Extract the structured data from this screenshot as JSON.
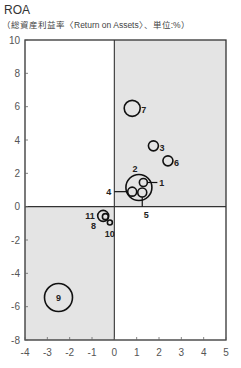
{
  "chart_data": {
    "type": "scatter",
    "title": "ROA",
    "subtitle": "（総資産利益率〈Return on Assets〉、単位:%）",
    "xlabel": "",
    "ylabel": "ROA (%)",
    "xlim": [
      -4,
      5
    ],
    "ylim": [
      -8,
      10
    ],
    "x_ticks": [
      -4,
      -3,
      -2,
      -1,
      0,
      1,
      2,
      3,
      4,
      5
    ],
    "y_ticks": [
      10,
      8,
      6,
      4,
      2,
      0,
      -2,
      -4,
      -6,
      -8
    ],
    "grid": false,
    "shaded_quadrants": [
      "top-right",
      "bottom-left"
    ],
    "colors": {
      "shade": "#e4e4e4",
      "axis": "#333333",
      "bubble_stroke": "#111111",
      "tick_text": "#555555"
    },
    "points": [
      {
        "label": "1",
        "x": 1.3,
        "y": 1.45,
        "size": 4,
        "label_pos": "right-leader"
      },
      {
        "label": "2",
        "x": 1.1,
        "y": 1.15,
        "size": 13,
        "label_pos": "top"
      },
      {
        "label": "3",
        "x": 1.75,
        "y": 3.65,
        "size": 5,
        "label_pos": "right"
      },
      {
        "label": "4",
        "x": 0.8,
        "y": 0.9,
        "size": 4.5,
        "label_pos": "left-leader"
      },
      {
        "label": "5",
        "x": 1.25,
        "y": 0.85,
        "size": 4.5,
        "label_pos": "bottom-leader"
      },
      {
        "label": "6",
        "x": 2.4,
        "y": 2.75,
        "size": 5,
        "label_pos": "right"
      },
      {
        "label": "7",
        "x": 0.8,
        "y": 5.9,
        "size": 8,
        "label_pos": "right"
      },
      {
        "label": "8",
        "x": -0.4,
        "y": -0.6,
        "size": 3,
        "label_pos": "bottom-left"
      },
      {
        "label": "9",
        "x": -2.5,
        "y": -5.45,
        "size": 14,
        "label_pos": "center"
      },
      {
        "label": "10",
        "x": -0.2,
        "y": -0.95,
        "size": 2.5,
        "label_pos": "bottom"
      },
      {
        "label": "11",
        "x": -0.5,
        "y": -0.55,
        "size": 5.5,
        "label_pos": "left"
      }
    ]
  }
}
